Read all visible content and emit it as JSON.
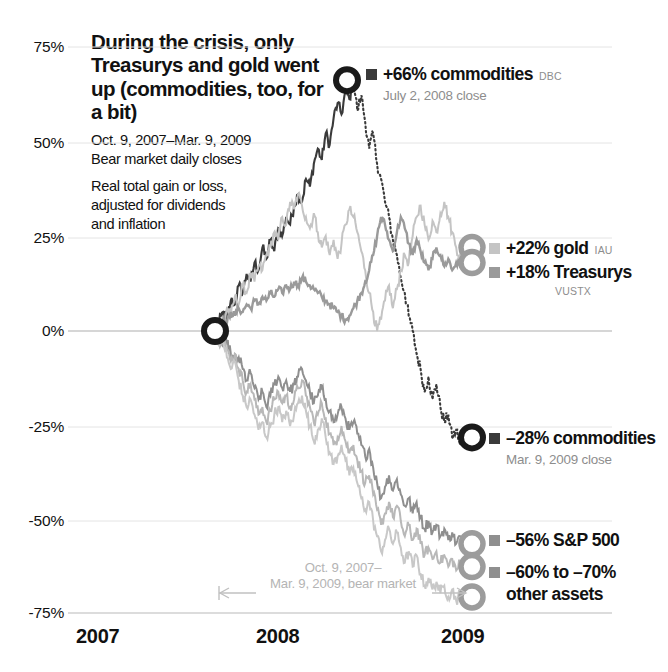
{
  "headline": "During the crisis, only Treasurys and gold went up (commodities, too, for a bit)",
  "subhead_line1": "Oct. 9, 2007–Mar. 9, 2009",
  "subhead_line2": "Bear market daily closes",
  "subhead_line3": "Real total gain or loss,",
  "subhead_line4": "adjusted for dividends",
  "subhead_line5": "and inflation",
  "bear_note_line1": "Oct. 9, 2007–",
  "bear_note_line2": "Mar. 9, 2009, bear market",
  "callouts": {
    "commodities_peak": {
      "value": "+66% commodities",
      "ticker": "DBC",
      "note": "July 2, 2008 close",
      "color": "#3a3a3a"
    },
    "gold": {
      "value": "+22% gold",
      "ticker": "IAU",
      "color": "#c4c4c4"
    },
    "treasurys": {
      "value": "+18% Treasurys",
      "ticker": "VUSTX",
      "color": "#9a9a9a"
    },
    "commodities_end": {
      "value": "–28% commodities",
      "note": "Mar. 9, 2009 close",
      "color": "#3a3a3a"
    },
    "sp500": {
      "value": "–56% S&P 500",
      "color": "#8f8f8f"
    },
    "other_assets": {
      "value": "–60% to –70%",
      "value_line2": "other assets",
      "color": "#8f8f8f"
    }
  },
  "chart_data": {
    "type": "line",
    "title": "During the crisis, only Treasurys and gold went up (commodities, too, for a bit)",
    "subtitle": "Oct. 9, 2007–Mar. 9, 2009 Bear market daily closes. Real total gain or loss, adjusted for dividends and inflation",
    "xlabel": "",
    "ylabel": "Real total gain or loss",
    "ylim": [
      -75,
      75
    ],
    "yticks": [
      75,
      50,
      25,
      0,
      -25,
      -50,
      -75
    ],
    "ytick_labels": [
      "75%",
      "50%",
      "25%",
      "0%",
      "-25%",
      "-50%",
      "-75%"
    ],
    "xticks": [
      2007,
      2008,
      2009
    ],
    "xtick_labels": [
      "2007",
      "2008",
      "2009"
    ],
    "grid": true,
    "legend": "annotations on series ends",
    "x_start_label": "Oct. 9, 2007",
    "x_end_label": "Mar. 9, 2009",
    "series": [
      {
        "name": "commodities",
        "ticker": "DBC",
        "color": "#3a3a3a",
        "style": "solid-then-dotted",
        "peak_value": 66,
        "peak_date": "July 2, 2008",
        "end_value": -28,
        "end_date": "Mar. 9, 2009",
        "values": [
          0,
          2,
          5,
          3,
          8,
          7,
          12,
          10,
          15,
          13,
          18,
          16,
          22,
          19,
          24,
          21,
          27,
          25,
          30,
          28,
          33,
          36,
          34,
          40,
          38,
          44,
          48,
          45,
          52,
          49,
          56,
          60,
          57,
          63,
          61,
          66,
          58,
          62,
          55,
          48,
          52,
          44,
          40,
          34,
          30,
          24,
          20,
          14,
          10,
          4,
          0,
          -6,
          -10,
          -16,
          -12,
          -18,
          -14,
          -20,
          -24,
          -22,
          -28,
          -26,
          -30,
          -27,
          -29,
          -28
        ]
      },
      {
        "name": "gold",
        "ticker": "IAU",
        "color": "#c4c4c4",
        "style": "solid",
        "end_value": 22,
        "values": [
          0,
          3,
          1,
          6,
          4,
          9,
          7,
          12,
          10,
          15,
          13,
          17,
          16,
          20,
          22,
          26,
          24,
          30,
          28,
          34,
          32,
          36,
          33,
          30,
          27,
          31,
          26,
          22,
          25,
          20,
          24,
          19,
          23,
          28,
          32,
          30,
          26,
          21,
          16,
          10,
          5,
          0,
          3,
          8,
          12,
          6,
          11,
          16,
          20,
          18,
          25,
          30,
          33,
          28,
          24,
          29,
          26,
          31,
          34,
          30,
          26,
          22,
          20,
          24,
          21,
          22
        ]
      },
      {
        "name": "treasurys",
        "ticker": "VUSTX",
        "color": "#9a9a9a",
        "style": "solid",
        "end_value": 18,
        "values": [
          0,
          1,
          3,
          2,
          5,
          4,
          6,
          5,
          7,
          6,
          8,
          7,
          9,
          8,
          10,
          9,
          11,
          10,
          12,
          11,
          13,
          12,
          14,
          13,
          12,
          11,
          10,
          9,
          8,
          7,
          6,
          5,
          4,
          3,
          4,
          6,
          8,
          10,
          13,
          16,
          20,
          25,
          30,
          28,
          24,
          21,
          26,
          30,
          27,
          23,
          20,
          24,
          21,
          18,
          16,
          19,
          22,
          20,
          17,
          19,
          16,
          18,
          17,
          19,
          18,
          18
        ]
      },
      {
        "name": "S&P 500",
        "color": "#8f8f8f",
        "style": "solid",
        "end_value": -56,
        "values": [
          0,
          -2,
          -4,
          -3,
          -6,
          -8,
          -7,
          -10,
          -13,
          -11,
          -15,
          -18,
          -16,
          -20,
          -17,
          -14,
          -12,
          -15,
          -13,
          -16,
          -14,
          -12,
          -10,
          -13,
          -16,
          -19,
          -17,
          -15,
          -18,
          -21,
          -24,
          -22,
          -20,
          -23,
          -26,
          -24,
          -27,
          -30,
          -33,
          -31,
          -36,
          -40,
          -44,
          -41,
          -38,
          -42,
          -39,
          -43,
          -46,
          -44,
          -48,
          -45,
          -49,
          -52,
          -50,
          -53,
          -51,
          -54,
          -52,
          -55,
          -53,
          -56,
          -54,
          -57,
          -55,
          -56
        ]
      },
      {
        "name": "other assets A",
        "color": "#b8b8b8",
        "style": "solid",
        "end_value": -62,
        "values": [
          0,
          -3,
          -1,
          -5,
          -8,
          -6,
          -10,
          -13,
          -16,
          -14,
          -18,
          -22,
          -20,
          -24,
          -21,
          -18,
          -16,
          -19,
          -17,
          -20,
          -18,
          -15,
          -13,
          -17,
          -20,
          -24,
          -22,
          -19,
          -23,
          -27,
          -30,
          -28,
          -25,
          -29,
          -32,
          -30,
          -34,
          -37,
          -40,
          -38,
          -43,
          -47,
          -51,
          -48,
          -45,
          -49,
          -46,
          -50,
          -54,
          -51,
          -55,
          -52,
          -56,
          -59,
          -57,
          -60,
          -58,
          -61,
          -59,
          -62,
          -60,
          -63,
          -61,
          -63,
          -62,
          -62
        ]
      },
      {
        "name": "other assets B",
        "color": "#c8c8c8",
        "style": "solid",
        "end_value": -70,
        "values": [
          0,
          -4,
          -2,
          -7,
          -10,
          -8,
          -13,
          -17,
          -20,
          -18,
          -22,
          -26,
          -24,
          -28,
          -25,
          -22,
          -20,
          -24,
          -21,
          -25,
          -22,
          -19,
          -17,
          -21,
          -25,
          -29,
          -26,
          -23,
          -28,
          -32,
          -35,
          -33,
          -30,
          -34,
          -38,
          -36,
          -40,
          -44,
          -47,
          -45,
          -50,
          -54,
          -58,
          -55,
          -52,
          -56,
          -53,
          -57,
          -61,
          -58,
          -62,
          -59,
          -64,
          -67,
          -65,
          -68,
          -66,
          -69,
          -67,
          -70,
          -68,
          -71,
          -69,
          -71,
          -70,
          -70
        ]
      }
    ],
    "markers": [
      {
        "name": "origin",
        "x_frac": 0.256,
        "value": 0,
        "style": "black-ring"
      },
      {
        "name": "commodities-peak",
        "value": 66,
        "style": "black-ring"
      },
      {
        "name": "gold-end",
        "value": 22,
        "style": "gray-ring"
      },
      {
        "name": "treasurys-end",
        "value": 18,
        "style": "gray-ring"
      },
      {
        "name": "commodities-end",
        "value": -28,
        "style": "black-ring"
      },
      {
        "name": "sp500-end",
        "value": -56,
        "style": "gray-ring"
      },
      {
        "name": "other-a-end",
        "value": -62,
        "style": "gray-ring"
      },
      {
        "name": "other-b-end",
        "value": -70,
        "style": "gray-ring"
      }
    ]
  },
  "axis": {
    "y_labels": [
      "75%",
      "50%",
      "25%",
      "0%",
      "-25%",
      "-50%",
      "-75%"
    ],
    "x_labels": [
      "2007",
      "2008",
      "2009"
    ]
  }
}
